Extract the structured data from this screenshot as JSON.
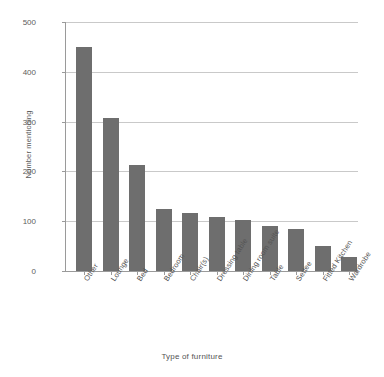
{
  "chart_data": {
    "type": "bar",
    "title": "",
    "xlabel": "Type of furniture",
    "ylabel": "Number mentioning",
    "categories": [
      "Other",
      "Lounge",
      "Bed",
      "Bedroom",
      "Chair(s)",
      "Dressing table",
      "Dining room suite",
      "Table",
      "Settee",
      "Fitted Kitchen",
      "Wardrobe"
    ],
    "values": [
      450,
      308,
      213,
      124,
      116,
      108,
      102,
      90,
      85,
      50,
      28
    ],
    "ylim": [
      0,
      500
    ],
    "yticks": [
      0,
      100,
      200,
      300,
      400,
      500
    ],
    "ytick_labels": [
      "0",
      "100",
      "200",
      "300",
      "400",
      "500"
    ],
    "grid": "horizontal",
    "legend": "none",
    "bar_color": "#6e6e6e",
    "gridline_color": "#c9c9c9",
    "axis_color": "#9a9a9a"
  }
}
